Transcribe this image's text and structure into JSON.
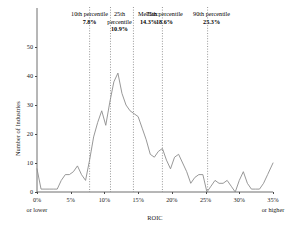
{
  "chart_data": {
    "type": "line",
    "title": "",
    "xlabel": "ROIC",
    "ylabel": "Number of Industries",
    "xlim": [
      0,
      35
    ],
    "ylim": [
      0,
      50
    ],
    "grid": false,
    "legend": "none",
    "line_color": "#8c8c8c",
    "x_tick_labels": [
      "0%",
      "5%",
      "10%",
      "15%",
      "20%",
      "25%",
      "30%",
      "35%"
    ],
    "x_tick_values": [
      0,
      5,
      10,
      15,
      20,
      25,
      30,
      35
    ],
    "x_tick_sub_first": "or lower",
    "x_tick_sub_last": "or higher",
    "y_tick_labels": [
      "0",
      "10",
      "20",
      "30",
      "40",
      "50"
    ],
    "y_tick_values": [
      0,
      10,
      20,
      30,
      40,
      50
    ],
    "x": [
      0.0,
      0.6,
      1.2,
      1.8,
      2.4,
      3.0,
      3.6,
      4.2,
      4.8,
      5.4,
      6.0,
      6.6,
      7.2,
      7.8,
      8.4,
      9.0,
      9.6,
      10.2,
      10.8,
      11.4,
      12.0,
      12.6,
      13.2,
      13.8,
      14.4,
      15.0,
      15.6,
      16.2,
      16.8,
      17.4,
      18.0,
      18.6,
      19.2,
      19.8,
      20.4,
      21.0,
      21.6,
      22.2,
      22.8,
      23.4,
      24.0,
      24.6,
      25.2,
      25.8,
      26.4,
      27.0,
      27.6,
      28.2,
      28.8,
      29.4,
      30.0,
      30.6,
      31.2,
      31.8,
      32.4,
      33.0,
      33.6,
      34.2,
      35.0
    ],
    "y": [
      8,
      1,
      1,
      1,
      1,
      1,
      4,
      6,
      6,
      7,
      9,
      6,
      4,
      11,
      19,
      24,
      28,
      23,
      31,
      38,
      41,
      34,
      30,
      28,
      27,
      26,
      22,
      18,
      13,
      12,
      14,
      15,
      11,
      8,
      12,
      13,
      10,
      7,
      3,
      5,
      6,
      6,
      0,
      2,
      4,
      3,
      3,
      4,
      2,
      0,
      4,
      7,
      3,
      1,
      1,
      1,
      3,
      6,
      10
    ],
    "annotations": [
      {
        "name": "10th percentile",
        "value": "7.8%",
        "x": 7.8
      },
      {
        "name": "25th percentile",
        "value": "10.9%",
        "x": 10.9
      },
      {
        "name": "Median:",
        "value": "14.3%",
        "x": 14.3
      },
      {
        "name": "75th percentile",
        "value": "18.6%",
        "x": 18.6
      },
      {
        "name": "90th percentile",
        "value": "25.3%",
        "x": 25.3
      }
    ]
  }
}
